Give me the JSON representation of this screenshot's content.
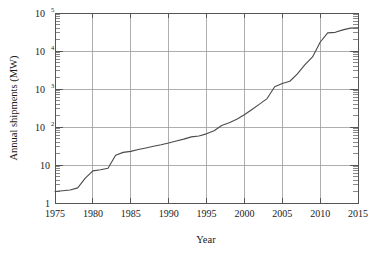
{
  "chart_data": {
    "type": "line",
    "title": "",
    "xlabel": "Year",
    "ylabel": "Annual shipments (MW)",
    "xlim": [
      1975,
      2015
    ],
    "ylim": [
      1,
      100000
    ],
    "yscale": "log",
    "xscale": "linear",
    "grid": true,
    "legend": null,
    "x_ticks": [
      "1975",
      "1980",
      "1985",
      "1990",
      "1995",
      "2000",
      "2005",
      "2010",
      "2015"
    ],
    "x_tick_values": [
      1975,
      1980,
      1985,
      1990,
      1995,
      2000,
      2005,
      2010,
      2015
    ],
    "y_ticks": [
      "1",
      "10",
      "10^2",
      "10^3",
      "10^4",
      "10^5"
    ],
    "y_tick_values": [
      1,
      10,
      100,
      1000,
      10000,
      100000
    ],
    "y_tick_mantissa": [
      "1",
      "10",
      "10",
      "10",
      "10",
      "10"
    ],
    "y_tick_exponent": [
      "",
      "",
      "2",
      "3",
      "4",
      "5"
    ],
    "series": [
      {
        "name": "Annual shipments",
        "x": [
          1975,
          1976,
          1977,
          1978,
          1979,
          1980,
          1981,
          1982,
          1983,
          1984,
          1985,
          1986,
          1987,
          1988,
          1989,
          1990,
          1991,
          1992,
          1993,
          1994,
          1995,
          1996,
          1997,
          1998,
          1999,
          2000,
          2001,
          2002,
          2003,
          2004,
          2005,
          2006,
          2007,
          2008,
          2009,
          2010,
          2011,
          2012,
          2013,
          2014,
          2015
        ],
        "values": [
          2.0,
          2.1,
          2.2,
          2.5,
          4.5,
          7.0,
          7.5,
          8.2,
          18.0,
          21.5,
          22.8,
          25.5,
          28.0,
          31.0,
          34.0,
          38.0,
          43.0,
          48.0,
          55.0,
          58.0,
          66.0,
          80.0,
          110.0,
          130.0,
          160.0,
          210.0,
          290.0,
          400.0,
          560.0,
          1150.0,
          1400.0,
          1600.0,
          2500.0,
          4400.0,
          7000.0,
          17000.0,
          30000.0,
          31000.0,
          36000.0,
          40000.0,
          41000.0
        ]
      }
    ]
  },
  "axis_titles": {
    "y": "Annual shipments (MW)",
    "x": "Year"
  }
}
